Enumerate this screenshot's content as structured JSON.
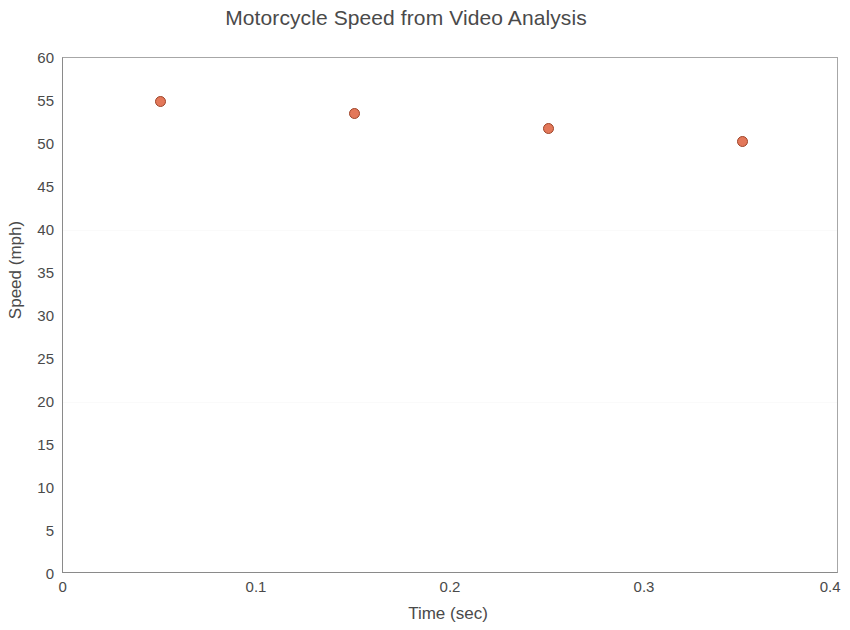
{
  "chart_data": {
    "type": "scatter",
    "title": "Motorcycle Speed from Video Analysis",
    "xlabel": "Time (sec)",
    "ylabel": "Speed (mph)",
    "xlim": [
      0,
      0.4
    ],
    "ylim": [
      0,
      60
    ],
    "xticks": [
      "0",
      "0.1",
      "0.2",
      "0.3",
      "0.4"
    ],
    "xtick_values": [
      0,
      0.1,
      0.2,
      0.3,
      0.4
    ],
    "yticks": [
      "0",
      "5",
      "10",
      "15",
      "20",
      "25",
      "30",
      "35",
      "40",
      "45",
      "50",
      "55",
      "60"
    ],
    "ytick_values": [
      0,
      5,
      10,
      15,
      20,
      25,
      30,
      35,
      40,
      45,
      50,
      55,
      60
    ],
    "grid": false,
    "legend": null,
    "marker": {
      "shape": "circle",
      "fill_color": "#e3785a",
      "edge_color": "#9e4428",
      "size_px": 11
    },
    "series": [
      {
        "name": "Motorcycle speed",
        "x": [
          0.05,
          0.15,
          0.25,
          0.35
        ],
        "values": [
          55.0,
          53.5,
          51.8,
          50.3
        ]
      }
    ]
  },
  "figure": {
    "background_color": "#ffffff",
    "axis_color": "#8a8a8a",
    "text_color": "#4a4a4a"
  }
}
